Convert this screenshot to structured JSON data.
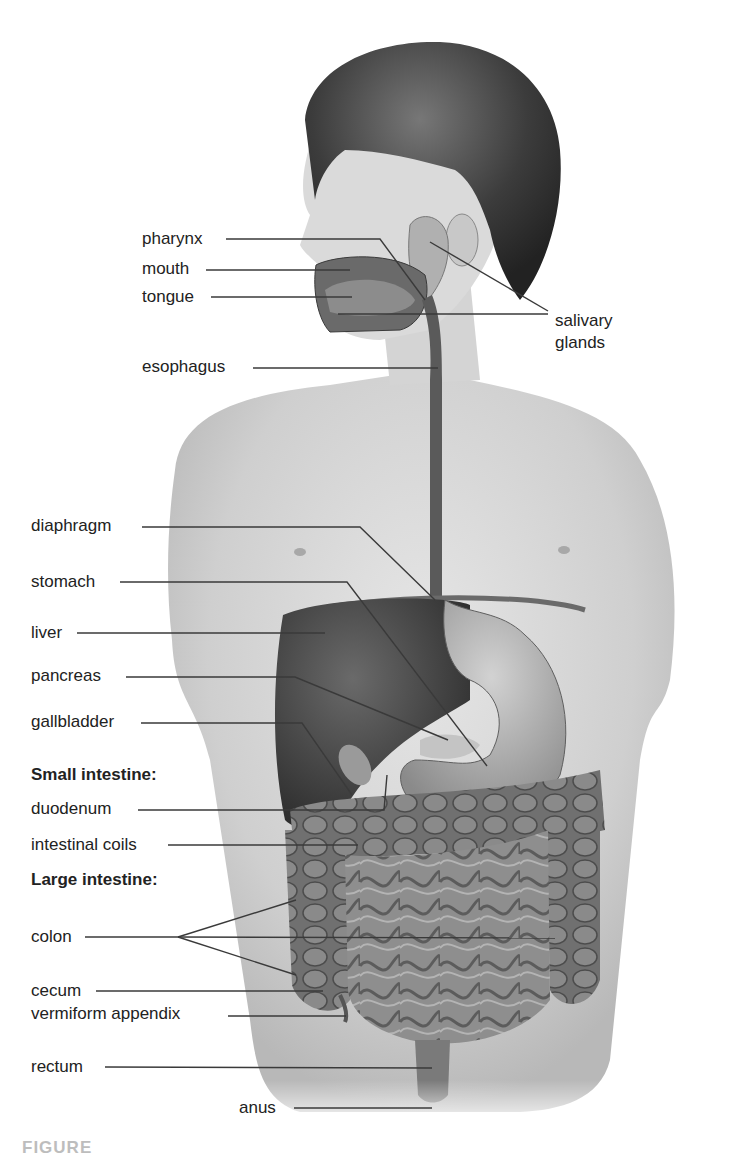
{
  "figure": {
    "labels": {
      "pharynx": "pharynx",
      "mouth": "mouth",
      "tongue": "tongue",
      "salivary_glands_line1": "salivary",
      "salivary_glands_line2": "glands",
      "esophagus": "esophagus",
      "diaphragm": "diaphragm",
      "stomach": "stomach",
      "liver": "liver",
      "pancreas": "pancreas",
      "gallbladder": "gallbladder",
      "small_intestine_heading": "Small intestine:",
      "duodenum": "duodenum",
      "intestinal_coils": "intestinal coils",
      "large_intestine_heading": "Large intestine:",
      "colon": "colon",
      "cecum": "cecum",
      "vermiform_appendix": "vermiform appendix",
      "rectum": "rectum",
      "anus": "anus"
    },
    "caption_fragment": "FIGURE",
    "colors": {
      "leader_line": "#3a3a3a",
      "skin": "#d9d9d9",
      "hair": "#4a4a4a",
      "liver": "#4d4d4d",
      "stomach": "#a8a8a8",
      "intestine": "#8c8c8c",
      "colon": "#6e6e6e"
    }
  }
}
